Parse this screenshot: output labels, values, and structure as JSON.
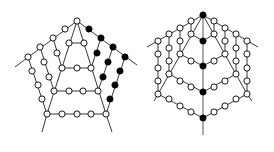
{
  "diagram": {
    "colors": {
      "edge": "#222222",
      "spine": "#888888",
      "node_open_fill": "#ffffff",
      "node_filled": "#000000",
      "node_stroke": "#000000"
    },
    "node_radius": 3.1,
    "left_figure": {
      "name": "pentagon-web",
      "edges": [
        [
          [
            77,
            21
          ],
          [
            15,
            67
          ]
        ],
        [
          [
            77,
            21
          ],
          [
            137,
            65
          ]
        ],
        [
          [
            77,
            21
          ],
          [
            47,
            114
          ]
        ],
        [
          [
            77,
            21
          ],
          [
            106,
            114
          ]
        ],
        [
          [
            47,
            114
          ],
          [
            42,
            132
          ]
        ],
        [
          [
            106,
            114
          ],
          [
            112,
            132
          ]
        ],
        [
          [
            69,
            43
          ],
          [
            84,
            43
          ]
        ],
        [
          [
            62,
            68
          ],
          [
            91,
            68
          ]
        ],
        [
          [
            54,
            91
          ],
          [
            98,
            91
          ]
        ],
        [
          [
            47,
            114
          ],
          [
            106,
            114
          ]
        ],
        [
          [
            28,
            57
          ],
          [
            47,
            114
          ]
        ],
        [
          [
            40,
            47
          ],
          [
            54,
            91
          ]
        ],
        [
          [
            53,
            38
          ],
          [
            62,
            68
          ]
        ],
        [
          [
            125,
            57
          ],
          [
            106,
            114
          ]
        ],
        [
          [
            113,
            47
          ],
          [
            98,
            91
          ]
        ],
        [
          [
            101,
            38
          ],
          [
            91,
            68
          ]
        ]
      ],
      "open_nodes": [
        [
          77,
          21
        ],
        [
          65,
          29
        ],
        [
          53,
          38
        ],
        [
          40,
          47
        ],
        [
          28,
          57
        ],
        [
          32,
          71
        ],
        [
          38,
          85
        ],
        [
          42,
          99
        ],
        [
          44,
          62
        ],
        [
          49,
          77
        ],
        [
          57,
          53
        ],
        [
          69,
          43
        ],
        [
          84,
          43
        ],
        [
          62,
          68
        ],
        [
          77,
          68
        ],
        [
          91,
          68
        ],
        [
          54,
          91
        ],
        [
          69,
          91
        ],
        [
          83,
          91
        ],
        [
          98,
          91
        ],
        [
          47,
          114
        ],
        [
          62,
          114
        ],
        [
          77,
          114
        ],
        [
          91,
          114
        ],
        [
          106,
          114
        ]
      ],
      "filled_nodes": [
        [
          89,
          29
        ],
        [
          101,
          38
        ],
        [
          113,
          47
        ],
        [
          125,
          57
        ],
        [
          97,
          53
        ],
        [
          108,
          62
        ],
        [
          120,
          71
        ],
        [
          103,
          77
        ],
        [
          115,
          85
        ],
        [
          110,
          99
        ]
      ]
    },
    "right_figure": {
      "name": "hexagon-web",
      "spine": [
        [
          203,
          15
        ],
        [
          203,
          135
        ]
      ],
      "edges": [
        [
          [
            203,
            15
          ],
          [
            147,
            47
          ]
        ],
        [
          [
            203,
            15
          ],
          [
            258,
            47
          ]
        ],
        [
          [
            203,
            15
          ],
          [
            158,
            94
          ]
        ],
        [
          [
            203,
            15
          ],
          [
            247,
            94
          ]
        ],
        [
          [
            158,
            94
          ],
          [
            154,
            101
          ]
        ],
        [
          [
            247,
            94
          ],
          [
            252,
            101
          ]
        ],
        [
          [
            158,
            41
          ],
          [
            158,
            94
          ]
        ],
        [
          [
            169,
            34
          ],
          [
            169,
            74
          ]
        ],
        [
          [
            180,
            28
          ],
          [
            180,
            54
          ]
        ],
        [
          [
            191,
            21
          ],
          [
            191,
            34
          ]
        ],
        [
          [
            247,
            41
          ],
          [
            247,
            94
          ]
        ],
        [
          [
            236,
            34
          ],
          [
            236,
            74
          ]
        ],
        [
          [
            225,
            28
          ],
          [
            225,
            54
          ]
        ],
        [
          [
            214,
            21
          ],
          [
            214,
            34
          ]
        ],
        [
          [
            191,
            34
          ],
          [
            203,
            41
          ]
        ],
        [
          [
            214,
            34
          ],
          [
            203,
            41
          ]
        ],
        [
          [
            180,
            54
          ],
          [
            203,
            66
          ]
        ],
        [
          [
            225,
            54
          ],
          [
            203,
            66
          ]
        ],
        [
          [
            169,
            74
          ],
          [
            203,
            92
          ]
        ],
        [
          [
            236,
            74
          ],
          [
            203,
            92
          ]
        ],
        [
          [
            158,
            94
          ],
          [
            203,
            118
          ]
        ],
        [
          [
            247,
            94
          ],
          [
            203,
            118
          ]
        ]
      ],
      "open_nodes": [
        [
          191,
          21
        ],
        [
          180,
          28
        ],
        [
          169,
          34
        ],
        [
          158,
          41
        ],
        [
          214,
          21
        ],
        [
          225,
          28
        ],
        [
          236,
          34
        ],
        [
          247,
          41
        ],
        [
          158,
          54
        ],
        [
          158,
          68
        ],
        [
          158,
          81
        ],
        [
          158,
          94
        ],
        [
          169,
          48
        ],
        [
          169,
          61
        ],
        [
          169,
          74
        ],
        [
          180,
          41
        ],
        [
          180,
          54
        ],
        [
          191,
          34
        ],
        [
          247,
          54
        ],
        [
          247,
          68
        ],
        [
          247,
          81
        ],
        [
          247,
          94
        ],
        [
          236,
          48
        ],
        [
          236,
          61
        ],
        [
          236,
          74
        ],
        [
          225,
          41
        ],
        [
          225,
          54
        ],
        [
          214,
          34
        ],
        [
          191,
          61
        ],
        [
          214,
          61
        ],
        [
          180,
          81
        ],
        [
          191,
          87
        ],
        [
          214,
          87
        ],
        [
          225,
          81
        ],
        [
          169,
          99
        ],
        [
          180,
          106
        ],
        [
          191,
          112
        ],
        [
          214,
          112
        ],
        [
          225,
          106
        ],
        [
          236,
          99
        ]
      ],
      "filled_nodes": [
        [
          203,
          15
        ],
        [
          203,
          41
        ],
        [
          203,
          66
        ],
        [
          203,
          92
        ],
        [
          203,
          118
        ]
      ]
    }
  }
}
